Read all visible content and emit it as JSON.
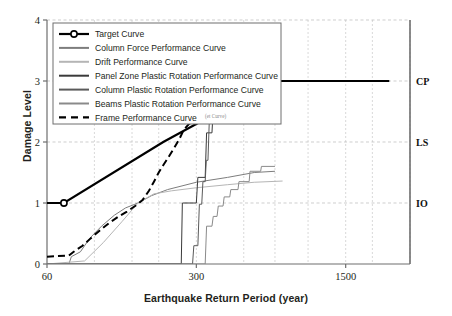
{
  "chart_data": {
    "type": "line",
    "title": "",
    "xlabel": "Earthquake Return Period (year)",
    "ylabel": "Damage Level",
    "xscale": "log",
    "xlim": [
      60,
      3000
    ],
    "ylim": [
      0,
      4
    ],
    "xticks": [
      "60",
      "300",
      "1500"
    ],
    "xtick_values": [
      60,
      300,
      1500
    ],
    "yticks": [
      "0",
      "1",
      "2",
      "3",
      "4"
    ],
    "ytick_values": [
      0,
      1,
      2,
      3,
      4
    ],
    "grid": true,
    "legend_position": "top-left",
    "right_axis_labels": [
      {
        "text": "CP",
        "value": 3
      },
      {
        "text": "LS",
        "value": 2
      },
      {
        "text": "IO",
        "value": 1
      }
    ],
    "series": [
      {
        "name": "Target Curve",
        "color": "#000000",
        "style": "solid",
        "width": 2.2,
        "markers": true,
        "points": [
          [
            60,
            1
          ],
          [
            72,
            1
          ],
          [
            210,
            2
          ],
          [
            700,
            3
          ],
          [
            2400,
            3
          ]
        ]
      },
      {
        "name": "Column Force Performance Curve",
        "color": "#7d7d7d",
        "style": "solid",
        "width": 1.0,
        "markers": false,
        "points": [
          [
            60,
            0.0
          ],
          [
            76,
            0.0
          ],
          [
            78,
            0.12
          ],
          [
            86,
            0.2
          ],
          [
            95,
            0.42
          ],
          [
            108,
            0.62
          ],
          [
            124,
            0.8
          ],
          [
            140,
            0.92
          ],
          [
            160,
            1.0
          ],
          [
            185,
            1.12
          ],
          [
            220,
            1.22
          ],
          [
            300,
            1.34
          ],
          [
            420,
            1.42
          ],
          [
            560,
            1.5
          ],
          [
            700,
            1.52
          ]
        ]
      },
      {
        "name": "Drift Performance Curve",
        "color": "#b5b5b5",
        "style": "solid",
        "width": 1.0,
        "markers": false,
        "points": [
          [
            60,
            0.0
          ],
          [
            90,
            0.05
          ],
          [
            110,
            0.35
          ],
          [
            135,
            0.7
          ],
          [
            160,
            1.0
          ],
          [
            190,
            1.15
          ],
          [
            230,
            1.2
          ],
          [
            300,
            1.25
          ],
          [
            420,
            1.3
          ],
          [
            560,
            1.34
          ],
          [
            760,
            1.36
          ]
        ]
      },
      {
        "name": "Panel Zone Plastic Rotation Performance Curve",
        "color": "#3a3a3a",
        "style": "solid",
        "width": 1.0,
        "markers": false,
        "points": [
          [
            60,
            0.0
          ],
          [
            255,
            0.0
          ],
          [
            258,
            1.0
          ],
          [
            300,
            1.0
          ],
          [
            305,
            1.42
          ],
          [
            330,
            1.42
          ],
          [
            335,
            2.15
          ],
          [
            355,
            2.15
          ],
          [
            360,
            2.55
          ],
          [
            400,
            2.55
          ],
          [
            405,
            2.82
          ],
          [
            430,
            2.82
          ],
          [
            435,
            3.0
          ],
          [
            560,
            3.0
          ]
        ]
      },
      {
        "name": "Column Plastic Rotation Performance Curve",
        "color": "#5a5a5a",
        "style": "solid",
        "width": 1.0,
        "markers": false,
        "points": [
          [
            60,
            0.0
          ],
          [
            288,
            0.0
          ],
          [
            292,
            0.3
          ],
          [
            305,
            0.3
          ],
          [
            310,
            0.98
          ],
          [
            318,
            0.98
          ],
          [
            322,
            1.35
          ],
          [
            330,
            1.35
          ],
          [
            334,
            1.7
          ],
          [
            340,
            1.7
          ],
          [
            345,
            2.35
          ],
          [
            360,
            2.35
          ],
          [
            365,
            2.45
          ],
          [
            400,
            2.45
          ],
          [
            405,
            2.6
          ],
          [
            440,
            2.6
          ],
          [
            445,
            2.72
          ],
          [
            520,
            2.72
          ]
        ]
      },
      {
        "name": "Beams Plastic Rotation Performance Curve",
        "color": "#8a8a8a",
        "style": "solid",
        "width": 1.0,
        "markers": false,
        "points": [
          [
            60,
            0.0
          ],
          [
            330,
            0.0
          ],
          [
            335,
            0.62
          ],
          [
            355,
            0.62
          ],
          [
            360,
            0.78
          ],
          [
            375,
            0.78
          ],
          [
            380,
            0.95
          ],
          [
            400,
            0.95
          ],
          [
            405,
            1.1
          ],
          [
            430,
            1.1
          ],
          [
            435,
            1.22
          ],
          [
            470,
            1.22
          ],
          [
            475,
            1.35
          ],
          [
            530,
            1.35
          ],
          [
            535,
            1.52
          ],
          [
            600,
            1.52
          ],
          [
            605,
            1.6
          ],
          [
            700,
            1.6
          ]
        ]
      },
      {
        "name": "Frame Performance Curve",
        "color": "#000000",
        "style": "dashed",
        "width": 2.0,
        "markers": false,
        "points": [
          [
            60,
            0.12
          ],
          [
            76,
            0.14
          ],
          [
            80,
            0.2
          ],
          [
            88,
            0.3
          ],
          [
            96,
            0.42
          ],
          [
            106,
            0.55
          ],
          [
            118,
            0.68
          ],
          [
            130,
            0.78
          ],
          [
            142,
            0.86
          ],
          [
            155,
            0.95
          ],
          [
            168,
            1.05
          ],
          [
            180,
            1.2
          ],
          [
            190,
            1.35
          ],
          [
            200,
            1.5
          ],
          [
            210,
            1.62
          ],
          [
            222,
            1.75
          ],
          [
            236,
            1.9
          ],
          [
            250,
            2.05
          ],
          [
            262,
            2.2
          ],
          [
            278,
            2.3
          ],
          [
            300,
            2.32
          ],
          [
            330,
            2.32
          ],
          [
            335,
            2.34
          ],
          [
            345,
            2.4
          ],
          [
            355,
            2.5
          ],
          [
            370,
            2.6
          ],
          [
            385,
            2.7
          ],
          [
            400,
            2.7
          ],
          [
            420,
            2.72
          ],
          [
            440,
            2.86
          ],
          [
            460,
            3.0
          ],
          [
            520,
            3.0
          ]
        ]
      }
    ],
    "legend": [
      {
        "label": "Target Curve",
        "color": "#000000",
        "style": "solid-marker",
        "width": 2.2
      },
      {
        "label": "Column Force Performance Curve",
        "color": "#7d7d7d",
        "style": "solid",
        "width": 2.0
      },
      {
        "label": "Drift Performance Curve",
        "color": "#b5b5b5",
        "style": "solid",
        "width": 2.0
      },
      {
        "label": "Panel Zone Plastic Rotation Performance Curve",
        "color": "#3a3a3a",
        "style": "solid",
        "width": 2.0
      },
      {
        "label": "Column Plastic Rotation Performance Curve",
        "color": "#5a5a5a",
        "style": "solid",
        "width": 2.0
      },
      {
        "label": "Beams Plastic Rotation Performance Curve",
        "color": "#8a8a8a",
        "style": "solid",
        "width": 2.0
      },
      {
        "label": "Frame Performance Curve",
        "color": "#000000",
        "style": "dashed",
        "width": 2.2
      }
    ],
    "overlap_artifact_text": "(et Curve)"
  }
}
